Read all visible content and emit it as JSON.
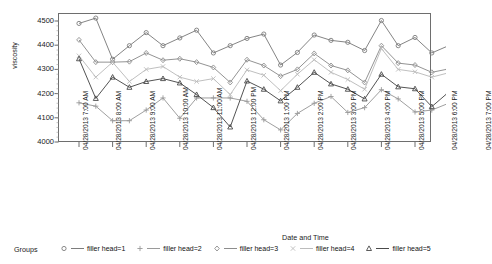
{
  "chart_data": {
    "type": "line",
    "title": "",
    "xlabel": "Date and Time",
    "ylabel": "viscosity",
    "ylim": [
      4000,
      4500
    ],
    "yticks": [
      4000,
      4100,
      4200,
      4300,
      4400,
      4500
    ],
    "grid": false,
    "legend_position": "bottom",
    "legend_title": "Groups",
    "x": [
      "04/28/2013 7:00 AM",
      "04/28/2013 7:30 AM",
      "04/28/2013 8:00 AM",
      "04/28/2013 8:30 AM",
      "04/28/2013 9:00 AM",
      "04/28/2013 9:30 AM",
      "04/28/2013 10:00 AM",
      "04/28/2013 10:30 AM",
      "04/28/2013 11:00 AM",
      "04/28/2013 11:30 AM",
      "04/28/2013 12:00 PM",
      "04/28/2013 12:30 PM",
      "04/28/2013 1:00 PM",
      "04/28/2013 1:30 PM",
      "04/28/2013 2:00 PM",
      "04/28/2013 2:30 PM",
      "04/28/2013 3:00 PM",
      "04/28/2013 3:30 PM",
      "04/28/2013 4:00 PM",
      "04/28/2013 4:30 PM",
      "04/28/2013 5:00 PM",
      "04/28/2013 5:30 PM",
      "04/28/2013 6:00 PM",
      "04/28/2013 6:30 PM"
    ],
    "xticks": [
      "04/28/2013 7:00 AM",
      "04/28/2013 8:00 AM",
      "04/28/2013 9:00 AM",
      "04/28/2013 10:00 AM",
      "04/28/2013 11:00 AM",
      "04/28/2013 12:00 PM",
      "04/28/2013 1:00 PM",
      "04/28/2013 2:00 PM",
      "04/28/2013 3:00 PM",
      "04/28/2013 4:00 PM",
      "04/28/2013 5:00 PM",
      "04/28/2013 6:00 PM",
      "04/28/2013 7:00 PM"
    ],
    "series": [
      {
        "name": "filler head=1",
        "marker": "circle",
        "color": "#7d7d7d",
        "values": [
          4490,
          4512,
          4342,
          4398,
          4452,
          4398,
          4430,
          4462,
          4368,
          4398,
          4428,
          4446,
          4318,
          4370,
          4442,
          4420,
          4412,
          4378,
          4502,
          4398,
          4432,
          4368,
          4398,
          4436
        ]
      },
      {
        "name": "filler head=2",
        "marker": "plus",
        "color": "#9a9a9a",
        "values": [
          4162,
          4148,
          4088,
          4088,
          4132,
          4182,
          4098,
          4182,
          4182,
          4182,
          4168,
          4092,
          4050,
          4118,
          4160,
          4188,
          4122,
          4142,
          4216,
          4178,
          4124,
          4132,
          4160,
          4182
        ]
      },
      {
        "name": "filler head=3",
        "marker": "diamond",
        "color": "#8d8d8d",
        "values": [
          4422,
          4330,
          4330,
          4332,
          4368,
          4338,
          4344,
          4330,
          4308,
          4246,
          4340,
          4316,
          4272,
          4300,
          4366,
          4316,
          4296,
          4246,
          4398,
          4326,
          4318,
          4288,
          4302,
          4322
        ]
      },
      {
        "name": "filler head=4",
        "marker": "x",
        "color": "#bcbcbc",
        "values": [
          4356,
          4268,
          4330,
          4250,
          4300,
          4312,
          4268,
          4250,
          4262,
          4196,
          4298,
          4276,
          4212,
          4280,
          4340,
          4288,
          4258,
          4218,
          4386,
          4300,
          4290,
          4268,
          4286,
          4312
        ]
      },
      {
        "name": "filler head=5",
        "marker": "triangle",
        "color": "#4a4a4a",
        "values": [
          4344,
          4180,
          4268,
          4226,
          4250,
          4262,
          4244,
          4196,
          4142,
          4062,
          4252,
          4218,
          4170,
          4226,
          4288,
          4240,
          4218,
          4178,
          4280,
          4228,
          4220,
          4146,
          4206,
          4258
        ]
      }
    ]
  },
  "legend": {
    "title": "Groups",
    "items": [
      {
        "label": "filler head=1",
        "marker": "circle-marker"
      },
      {
        "label": "filler head=2",
        "marker": "plus-marker"
      },
      {
        "label": "filler head=3",
        "marker": "diamond-marker"
      },
      {
        "label": "filler head=4",
        "marker": "x-marker"
      },
      {
        "label": "filler head=5",
        "marker": "triangle-marker"
      }
    ]
  },
  "axes": {
    "y_title": "viscosity",
    "x_title": "Date and Time",
    "y_tick_labels": [
      "4500",
      "4400",
      "4300",
      "4200",
      "4100",
      "4000"
    ],
    "x_tick_labels": [
      "04/28/2013 7:00 AM",
      "04/28/2013 8:00 AM",
      "04/28/2013 9:00 AM",
      "04/28/2013 10:00 AM",
      "04/28/2013 11:00 AM",
      "04/28/2013 12:00 PM",
      "04/28/2013 1:00 PM",
      "04/28/2013 2:00 PM",
      "04/28/2013 3:00 PM",
      "04/28/2013 4:00 PM",
      "04/28/2013 5:00 PM",
      "04/28/2013 6:00 PM",
      "04/28/2013 7:00 PM"
    ]
  },
  "colors": {
    "frame": "#6e6e6e",
    "series1": "#7d7d7d",
    "series2": "#9a9a9a",
    "series3": "#8d8d8d",
    "series4": "#bcbcbc",
    "series5": "#4a4a4a"
  }
}
